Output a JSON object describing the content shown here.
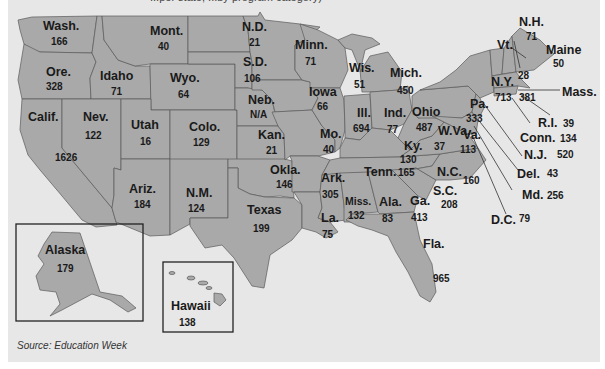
{
  "title_cut": "...per state, ...by program category)",
  "source": "Source: Education Week",
  "colors": {
    "state_fill": "#a9a9a9",
    "background": "#e7e7e7",
    "border": "#5a5a5a"
  },
  "states": {
    "wa": {
      "name": "Wash.",
      "value": "166"
    },
    "mt": {
      "name": "Mont.",
      "value": "40"
    },
    "nd": {
      "name": "N.D.",
      "value": "21"
    },
    "mn": {
      "name": "Minn.",
      "value": "71"
    },
    "or": {
      "name": "Ore.",
      "value": "328"
    },
    "id": {
      "name": "Idaho",
      "value": "71"
    },
    "wy": {
      "name": "Wyo.",
      "value": "64"
    },
    "sd": {
      "name": "S.D.",
      "value": "106"
    },
    "wi": {
      "name": "Wis.",
      "value": "51"
    },
    "mi": {
      "name": "Mich.",
      "value": "450"
    },
    "ia": {
      "name": "Iowa",
      "value": "66"
    },
    "ne": {
      "name": "Neb.",
      "value": "N/A"
    },
    "ca": {
      "name": "Calif.",
      "value": "1626"
    },
    "nv": {
      "name": "Nev.",
      "value": "122"
    },
    "ut": {
      "name": "Utah",
      "value": "16"
    },
    "co": {
      "name": "Colo.",
      "value": "129"
    },
    "ks": {
      "name": "Kan.",
      "value": "21"
    },
    "mo": {
      "name": "Mo.",
      "value": "40"
    },
    "il": {
      "name": "Ill.",
      "value": "694"
    },
    "in": {
      "name": "Ind.",
      "value": "77"
    },
    "oh": {
      "name": "Ohio",
      "value": "487"
    },
    "pa": {
      "name": "Pa.",
      "value": "333"
    },
    "ny": {
      "name": "N.Y.",
      "value": "713"
    },
    "vt": {
      "name": "Vt.",
      "value": "28"
    },
    "nh": {
      "name": "N.H.",
      "value": "71"
    },
    "me": {
      "name": "Maine",
      "value": "50"
    },
    "ma": {
      "name": "Mass.",
      "value": "381"
    },
    "ri": {
      "name": "R.I.",
      "value": "39"
    },
    "ct": {
      "name": "Conn.",
      "value": "134"
    },
    "nj": {
      "name": "N.J.",
      "value": "520"
    },
    "de": {
      "name": "Del.",
      "value": "43"
    },
    "md": {
      "name": "Md.",
      "value": "256"
    },
    "dc": {
      "name": "D.C.",
      "value": "79"
    },
    "wv": {
      "name": "W.Va.",
      "value": "37"
    },
    "va": {
      "name": "Va.",
      "value": "113"
    },
    "ky": {
      "name": "Ky.",
      "value": "130"
    },
    "tn": {
      "name": "Tenn.",
      "value": "165"
    },
    "nc": {
      "name": "N.C.",
      "value": "160"
    },
    "sc": {
      "name": "S.C.",
      "value": "208"
    },
    "az": {
      "name": "Ariz.",
      "value": "184"
    },
    "nm": {
      "name": "N.M.",
      "value": "124"
    },
    "ok": {
      "name": "Okla.",
      "value": "146"
    },
    "ar": {
      "name": "Ark.",
      "value": "305"
    },
    "tx": {
      "name": "Texas",
      "value": "199"
    },
    "la": {
      "name": "La.",
      "value": "75"
    },
    "ms": {
      "name": "Miss.",
      "value": "132"
    },
    "al": {
      "name": "Ala.",
      "value": "83"
    },
    "ga": {
      "name": "Ga.",
      "value": "413"
    },
    "fl": {
      "name": "Fla.",
      "value": "965"
    },
    "ak": {
      "name": "Alaska",
      "value": "179"
    },
    "hi": {
      "name": "Hawaii",
      "value": "138"
    }
  }
}
